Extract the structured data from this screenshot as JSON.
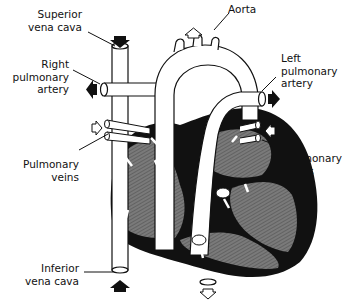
{
  "diagram": {
    "type": "anatomical-illustration",
    "colors": {
      "outline": "#111111",
      "muscle": "#111111",
      "chamber_fill": "#6e6e6e",
      "vessel_fill": "#ffffff",
      "background": "#ffffff"
    },
    "arrows": {
      "deoxygenated": "filled-black",
      "oxygenated": "hollow-white"
    }
  },
  "labels": {
    "superior_vena_cava": [
      "Superior",
      "vena cava"
    ],
    "right_pulmonary_artery": [
      "Right",
      "pulmonary",
      "artery"
    ],
    "pulmonary_veins_left": [
      "Pulmonary",
      "veins"
    ],
    "inferior_vena_cava": [
      "Inferior",
      "vena cava"
    ],
    "aorta": [
      "Aorta"
    ],
    "left_pulmonary_artery": [
      "Left",
      "pulmonary",
      "artery"
    ],
    "pulmonary_veins_right": [
      "Pulmonary",
      "veins"
    ]
  }
}
